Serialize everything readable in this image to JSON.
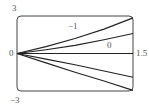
{
  "chart_data": {
    "type": "line",
    "title": "",
    "xlabel": "",
    "ylabel": "",
    "xlim": [
      0,
      1.5
    ],
    "ylim": [
      -3,
      3
    ],
    "grid": false,
    "tick_labels": {
      "y_top": "3",
      "y_bottom": "−3",
      "y_origin": "0",
      "x_right": "1.5"
    },
    "annotations": [
      {
        "text": "−1",
        "x": 0.7,
        "y": 2.2
      },
      {
        "text": "0",
        "x": 1.18,
        "y": 0.55
      }
    ],
    "series": [
      {
        "name": "curve-1",
        "x": [
          0,
          0.375,
          0.75,
          1.125,
          1.5
        ],
        "y": [
          0,
          0.55,
          1.2,
          1.95,
          2.85
        ]
      },
      {
        "name": "curve-2",
        "x": [
          0,
          0.375,
          0.75,
          1.125,
          1.5
        ],
        "y": [
          0,
          0.3,
          0.65,
          1.1,
          1.6
        ]
      },
      {
        "name": "curve-3",
        "x": [
          0,
          0.375,
          0.75,
          1.125,
          1.5
        ],
        "y": [
          0,
          0,
          0,
          0,
          0
        ]
      },
      {
        "name": "curve-4",
        "x": [
          0,
          0.375,
          0.75,
          1.125,
          1.5
        ],
        "y": [
          0,
          -0.45,
          -0.9,
          -1.4,
          -1.9
        ]
      },
      {
        "name": "curve-5",
        "x": [
          0,
          0.375,
          0.75,
          1.125,
          1.5
        ],
        "y": [
          0,
          -0.75,
          -1.5,
          -2.2,
          -2.95
        ]
      }
    ],
    "colors": {
      "curve": "#222222",
      "frame": "#444444",
      "axis": "#999999",
      "text": "#555555"
    }
  }
}
